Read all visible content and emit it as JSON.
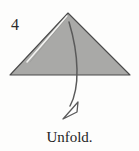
{
  "figure": {
    "step_number": "4",
    "caption": "Unfold.",
    "shape_name": "folded-paper-triangle",
    "arrow_name": "unfold-direction-arrow",
    "colors": {
      "background": "#fdfdfc",
      "paper_fill": "#a9a9a7",
      "paper_outline": "#4a4a4a",
      "crease_line": "#f2f2f0",
      "arrow_stroke": "#5a5a5a",
      "arrowhead_fill": "#ffffff",
      "text": "#1f1f1f"
    },
    "geometry": {
      "triangle_apex": [
        68,
        13
      ],
      "triangle_base_left": [
        10,
        75
      ],
      "triangle_base_right": [
        130,
        75
      ],
      "crease_from": [
        66,
        16
      ],
      "crease_to": [
        26,
        62
      ],
      "arrow_start": [
        69,
        22
      ],
      "arrow_control_1": [
        79,
        55
      ],
      "arrow_control_2": [
        80,
        88
      ],
      "arrow_end": [
        70,
        105
      ],
      "arrowhead_tip": [
        63,
        119
      ],
      "arrowhead_back_upper": [
        78,
        103
      ],
      "arrowhead_back_lower": [
        77,
        112
      ]
    }
  }
}
